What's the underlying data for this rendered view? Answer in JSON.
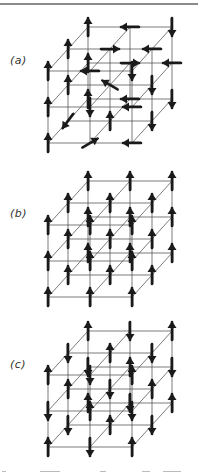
{
  "figure": {
    "top_rule": true,
    "line_color": "#444444",
    "arrow_color": "#1a1a1a",
    "lattice": {
      "size": 3,
      "front_origin_note": "front-bottom-left site",
      "dx": 42,
      "dy": 36,
      "depth_dx": 20,
      "depth_dy": 22
    },
    "panels": [
      {
        "id": "a",
        "label": "(a)",
        "label_y": 60,
        "origin": [
          48,
          143
        ],
        "ordering": "paramagnetic (random orientations)",
        "spins": [
          [
            [
              "up",
              "right-up",
              "left"
            ],
            [
              "up",
              "down",
              "left"
            ],
            [
              "up",
              "left",
              "down"
            ]
          ],
          [
            [
              "down-left",
              "up",
              "down"
            ],
            [
              "up",
              "left-up",
              "down"
            ],
            [
              "up",
              "right",
              "left"
            ]
          ],
          [
            [
              "up",
              "left",
              "down"
            ],
            [
              "up",
              "right",
              "left"
            ],
            [
              "up",
              "left",
              "down"
            ]
          ]
        ]
      },
      {
        "id": "b",
        "label": "(b)",
        "label_y": 213,
        "origin": [
          48,
          297
        ],
        "ordering": "ferromagnetic (all parallel)",
        "spins": [
          [
            [
              "up",
              "up",
              "up"
            ],
            [
              "up",
              "up",
              "up"
            ],
            [
              "up",
              "up",
              "up"
            ]
          ],
          [
            [
              "up",
              "up",
              "up"
            ],
            [
              "up",
              "up",
              "up"
            ],
            [
              "up",
              "up",
              "up"
            ]
          ],
          [
            [
              "up",
              "up",
              "up"
            ],
            [
              "up",
              "up",
              "up"
            ],
            [
              "up",
              "up",
              "up"
            ]
          ]
        ]
      },
      {
        "id": "c",
        "label": "(c)",
        "label_y": 364,
        "origin": [
          48,
          447
        ],
        "ordering": "antiferromagnetic (alternating)",
        "spins": [
          [
            [
              "up",
              "down",
              "up"
            ],
            [
              "down",
              "up",
              "down"
            ],
            [
              "up",
              "down",
              "up"
            ]
          ],
          [
            [
              "down",
              "up",
              "down"
            ],
            [
              "up",
              "down",
              "up"
            ],
            [
              "down",
              "up",
              "down"
            ]
          ],
          [
            [
              "up",
              "down",
              "up"
            ],
            [
              "down",
              "up",
              "down"
            ],
            [
              "up",
              "down",
              "up"
            ]
          ]
        ]
      }
    ]
  }
}
